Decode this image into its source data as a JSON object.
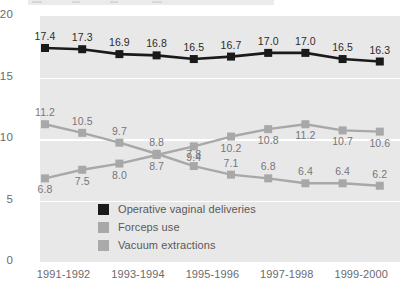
{
  "chart_data": {
    "type": "line",
    "title": "",
    "xlabel": "",
    "ylabel": "",
    "ylim": [
      0,
      20
    ],
    "yticks": [
      0,
      5,
      10,
      15,
      20
    ],
    "grid": true,
    "legend_position": "inside-bottom-left",
    "x": [
      1,
      2,
      3,
      4,
      5,
      6,
      7,
      8,
      9,
      10
    ],
    "categories": [
      "1991",
      "1992",
      "1993",
      "1994",
      "1995",
      "1996",
      "1997",
      "1998",
      "1999",
      "2000"
    ],
    "xtick_labels": [
      "1991-1992",
      "1993-1994",
      "1995-1996",
      "1997-1998",
      "1999-2000"
    ],
    "xtick_positions": [
      1.5,
      3.5,
      5.5,
      7.5,
      9.5
    ],
    "series": [
      {
        "name": "Operative vaginal deliveries",
        "color": "#1a1a1a",
        "marker": "square",
        "label_position": "above",
        "values": [
          17.4,
          17.3,
          16.9,
          16.8,
          16.5,
          16.7,
          17.0,
          17.0,
          16.5,
          16.3
        ],
        "value_labels": [
          "17.4",
          "17.3",
          "16.9",
          "16.8",
          "16.5",
          "16.7",
          "17.0",
          "17.0",
          "16.5",
          "16.3"
        ]
      },
      {
        "name": "Forceps use",
        "color": "#a8a8a8",
        "marker": "square",
        "label_position": "above",
        "values": [
          11.2,
          10.5,
          9.7,
          8.8,
          7.8,
          7.1,
          6.8,
          6.4,
          6.4,
          6.2
        ],
        "value_labels": [
          "11.2",
          "10.5",
          "9.7",
          "8.8",
          "7.8",
          "7.1",
          "6.8",
          "6.4",
          "6.4",
          "6.2"
        ]
      },
      {
        "name": "Vacuum extractions",
        "color": "#a8a8a8",
        "marker": "square",
        "label_position": "below",
        "values": [
          6.8,
          7.5,
          8.0,
          8.7,
          9.4,
          10.2,
          10.8,
          11.2,
          10.7,
          10.6
        ],
        "value_labels": [
          "6.8",
          "7.5",
          "8.0",
          "8.7",
          "9.4",
          "10.2",
          "10.8",
          "11.2",
          "10.7",
          "10.6"
        ]
      }
    ],
    "legend": [
      {
        "label": "Operative vaginal deliveries",
        "color": "#1a1a1a"
      },
      {
        "label": "Forceps use",
        "color": "#a8a8a8"
      },
      {
        "label": "Vacuum extractions",
        "color": "#aaaaaa"
      }
    ]
  },
  "colors": {
    "plot_background": "#e9e8e8",
    "gridline": "#ffffff",
    "dark_series": "#1a1a1a",
    "gray_series": "#a8a8a8",
    "axis_text": "#6b6b6d"
  }
}
